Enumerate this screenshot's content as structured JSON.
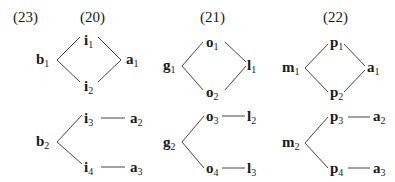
{
  "example_labels": [
    {
      "id": "ex23",
      "text": "(23)",
      "x": 13,
      "y": 22
    },
    {
      "id": "ex20",
      "text": "(20)",
      "x": 80,
      "y": 22
    },
    {
      "id": "ex21",
      "text": "(21)",
      "x": 200,
      "y": 22
    },
    {
      "id": "ex22",
      "text": "(22)",
      "x": 323,
      "y": 22
    }
  ],
  "diagrams": [
    {
      "id": "d20",
      "top": {
        "nodes": [
          {
            "base": "i",
            "sub": "1",
            "x": 84,
            "y": 45
          },
          {
            "base": "b",
            "sub": "1",
            "x": 36,
            "y": 64
          },
          {
            "base": "a",
            "sub": "1",
            "x": 126,
            "y": 64
          },
          {
            "base": "i",
            "sub": "2",
            "x": 84,
            "y": 91
          }
        ],
        "edges": [
          [
            57,
            60,
            80,
            37
          ],
          [
            57,
            60,
            80,
            82
          ],
          [
            98,
            37,
            121,
            60
          ],
          [
            98,
            82,
            121,
            60
          ]
        ]
      },
      "bottom": {
        "nodes": [
          {
            "base": "i",
            "sub": "3",
            "x": 84,
            "y": 123
          },
          {
            "base": "a",
            "sub": "2",
            "x": 130,
            "y": 123
          },
          {
            "base": "b",
            "sub": "2",
            "x": 36,
            "y": 146
          },
          {
            "base": "i",
            "sub": "4",
            "x": 84,
            "y": 172
          },
          {
            "base": "a",
            "sub": "3",
            "x": 130,
            "y": 172
          }
        ],
        "edges": [
          [
            57,
            142,
            82,
            115
          ],
          [
            57,
            142,
            82,
            164
          ],
          [
            101,
            118,
            125,
            118
          ],
          [
            101,
            167,
            125,
            167
          ]
        ]
      }
    },
    {
      "id": "d21",
      "top": {
        "nodes": [
          {
            "base": "o",
            "sub": "1",
            "x": 206,
            "y": 47
          },
          {
            "base": "g",
            "sub": "1",
            "x": 163,
            "y": 70
          },
          {
            "base": "l",
            "sub": "1",
            "x": 247,
            "y": 70
          },
          {
            "base": "o",
            "sub": "2",
            "x": 206,
            "y": 97
          }
        ],
        "edges": [
          [
            182,
            66,
            203,
            42
          ],
          [
            182,
            66,
            203,
            90
          ],
          [
            225,
            42,
            246,
            62
          ],
          [
            225,
            90,
            246,
            66
          ]
        ]
      },
      "bottom": {
        "nodes": [
          {
            "base": "o",
            "sub": "3",
            "x": 206,
            "y": 121
          },
          {
            "base": "l",
            "sub": "2",
            "x": 247,
            "y": 121
          },
          {
            "base": "g",
            "sub": "2",
            "x": 163,
            "y": 147
          },
          {
            "base": "o",
            "sub": "4",
            "x": 206,
            "y": 173
          },
          {
            "base": "l",
            "sub": "3",
            "x": 247,
            "y": 173
          }
        ],
        "edges": [
          [
            182,
            142,
            204,
            116
          ],
          [
            182,
            142,
            204,
            168
          ],
          [
            222,
            116,
            245,
            116
          ],
          [
            222,
            168,
            245,
            168
          ]
        ]
      }
    },
    {
      "id": "d22",
      "top": {
        "nodes": [
          {
            "base": "p",
            "sub": "1",
            "x": 330,
            "y": 47
          },
          {
            "base": "m",
            "sub": "1",
            "x": 282,
            "y": 72
          },
          {
            "base": "a",
            "sub": "1",
            "x": 367,
            "y": 72
          },
          {
            "base": "p",
            "sub": "2",
            "x": 330,
            "y": 97
          }
        ],
        "edges": [
          [
            305,
            68,
            328,
            44
          ],
          [
            305,
            68,
            328,
            92
          ],
          [
            344,
            44,
            365,
            66
          ],
          [
            344,
            92,
            365,
            70
          ]
        ]
      },
      "bottom": {
        "nodes": [
          {
            "base": "p",
            "sub": "3",
            "x": 330,
            "y": 121
          },
          {
            "base": "a",
            "sub": "2",
            "x": 373,
            "y": 121
          },
          {
            "base": "m",
            "sub": "2",
            "x": 282,
            "y": 147
          },
          {
            "base": "p",
            "sub": "4",
            "x": 330,
            "y": 173
          },
          {
            "base": "a",
            "sub": "3",
            "x": 373,
            "y": 173
          }
        ],
        "edges": [
          [
            305,
            143,
            328,
            117
          ],
          [
            305,
            143,
            328,
            168
          ],
          [
            348,
            117,
            370,
            117
          ],
          [
            348,
            168,
            370,
            168
          ]
        ]
      }
    }
  ]
}
